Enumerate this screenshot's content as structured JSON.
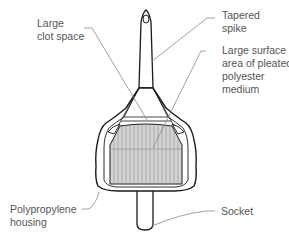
{
  "diagram": {
    "colors": {
      "outline": "#1a1a1a",
      "leader": "#8a8a8a",
      "filter_fill": "#d4d4d4",
      "pleat_line": "#8a8a8a",
      "text": "#555555",
      "background": "#ffffff"
    },
    "labels": [
      {
        "id": "clot-space",
        "lines": [
          "Large",
          "clot space"
        ]
      },
      {
        "id": "tapered-spike",
        "lines": [
          "Tapered",
          "spike"
        ]
      },
      {
        "id": "pleated-medium",
        "lines": [
          "Large surface",
          "area of pleated",
          "polyester",
          "medium"
        ]
      },
      {
        "id": "housing",
        "lines": [
          "Polypropylene",
          "housing"
        ]
      },
      {
        "id": "socket",
        "lines": [
          "Socket"
        ]
      }
    ]
  }
}
